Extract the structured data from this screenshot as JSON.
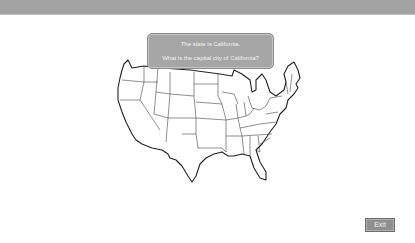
{
  "top_bar": {},
  "question": {
    "line1": "The state is California.",
    "line2": "What is the capital city of California?"
  },
  "map": {
    "icon": "us-states-outline-map"
  },
  "exit_button": {
    "label": "Exit"
  },
  "colors": {
    "top_bar": "#a3a3a3",
    "dialog_bg": "#a6a6a6",
    "button_bg": "#8f8f8f",
    "map_stroke": "#333333"
  }
}
